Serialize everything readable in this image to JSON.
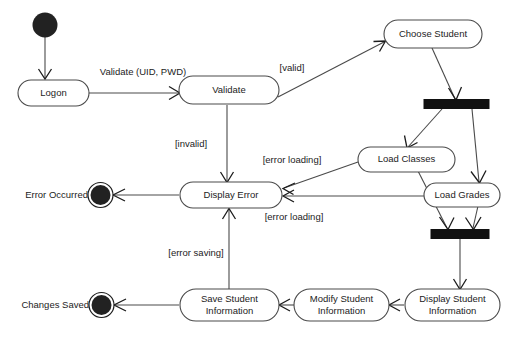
{
  "diagram": {
    "type": "uml-activity-diagram",
    "colors": {
      "background": "#ffffff",
      "node_stroke": "#4a4a4a",
      "node_fill": "#ffffff",
      "text": "#1c1c1c",
      "bar_fill": "#111111",
      "terminal_fill": "#222222"
    },
    "nodes": {
      "start": {
        "kind": "initial",
        "label": ""
      },
      "logon": {
        "kind": "action",
        "label": "Logon"
      },
      "validate": {
        "kind": "action",
        "label": "Validate"
      },
      "choose_student": {
        "kind": "action",
        "label": "Choose Student"
      },
      "fork_bar": {
        "kind": "fork",
        "label": ""
      },
      "load_classes": {
        "kind": "action",
        "label": "Load Classes"
      },
      "load_grades": {
        "kind": "action",
        "label": "Load Grades"
      },
      "join_bar": {
        "kind": "join",
        "label": ""
      },
      "display_error": {
        "kind": "action",
        "label": "Display Error"
      },
      "display_student": {
        "kind": "action",
        "line1": "Display Student",
        "line2": "Information"
      },
      "modify_student": {
        "kind": "action",
        "line1": "Modify Student",
        "line2": "Information"
      },
      "save_student": {
        "kind": "action",
        "line1": "Save Student",
        "line2": "Information"
      },
      "error_occurred": {
        "kind": "final",
        "label": "Error Occurred"
      },
      "changes_saved": {
        "kind": "final",
        "label": "Changes Saved"
      }
    },
    "edge_labels": {
      "validate_call": "Validate (UID, PWD)",
      "valid": "[valid]",
      "invalid": "[invalid]",
      "error_loading_classes": "[error loading]",
      "error_loading_grades": "[error loading]",
      "error_saving": "[error saving]"
    }
  }
}
